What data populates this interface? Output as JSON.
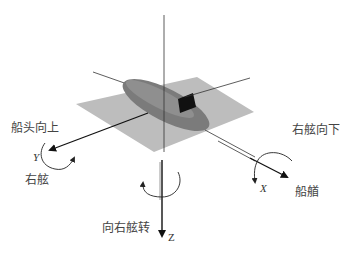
{
  "diagram": {
    "type": "ship-motion-coordinate-system",
    "colors": {
      "plane": "#b9b9b9",
      "hull": "#7a7a7a",
      "hull_highlight": "#9a9a9a",
      "bridge": "#111111",
      "axis": "#222222"
    },
    "axes": {
      "x": {
        "letter": "X",
        "direction_label": "船艏",
        "rotation_label": "右舷向下"
      },
      "y": {
        "letter": "Y",
        "direction_label": "右舷",
        "rotation_label": "船头向上"
      },
      "z": {
        "letter": "Z",
        "rotation_label": "向右舷转"
      }
    },
    "caption": ""
  }
}
